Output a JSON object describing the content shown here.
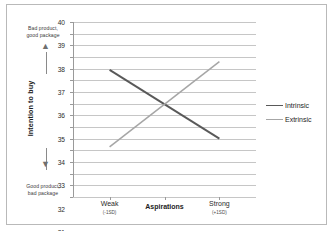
{
  "chart_data": {
    "type": "line",
    "title": "",
    "xlabel": "Aspirations",
    "ylabel": "Intention to buy",
    "categories": [
      "Weak",
      "Strong"
    ],
    "category_sublabels": [
      "(-1SD)",
      "(+1SD)"
    ],
    "ylim": [
      25,
      40
    ],
    "ytick_step": 1,
    "yticks": [
      40,
      39,
      38,
      37,
      36,
      35,
      34,
      33,
      32,
      31,
      30,
      29,
      28,
      27,
      26,
      25
    ],
    "grid": true,
    "legend_position": "right",
    "series": [
      {
        "name": "Intrinsic",
        "values": [
          35.9,
          30.0
        ],
        "color": "#595959",
        "width": 1.9
      },
      {
        "name": "Extrinsic",
        "values": [
          29.3,
          36.6
        ],
        "color": "#a6a6a6",
        "width": 1.5
      }
    ],
    "annotations": {
      "y_axis_high_anchor": "Bad product,\ngood package",
      "y_axis_low_anchor": "Good product,\nbad package",
      "high_arrow": "up-arrow",
      "low_arrow": "down-arrow"
    }
  },
  "axis": {
    "y_title": "Intention to buy",
    "x_title": "Aspirations",
    "anchor_top_line1": "Bad product,",
    "anchor_top_line2": "good package",
    "anchor_bottom_line1": "Good product,",
    "anchor_bottom_line2": "bad package",
    "arrow_up_glyph": "▲",
    "arrow_down_glyph": "▼"
  },
  "legend": {
    "items": [
      {
        "label": "Intrinsic"
      },
      {
        "label": "Extrinsic"
      }
    ]
  },
  "colors": {
    "intrinsic": "#595959",
    "extrinsic": "#a6a6a6",
    "gridline": "#c6c6c6",
    "axis": "#9a9a9a",
    "frame": "#b9b9b9",
    "text": "#2b2b2b"
  }
}
